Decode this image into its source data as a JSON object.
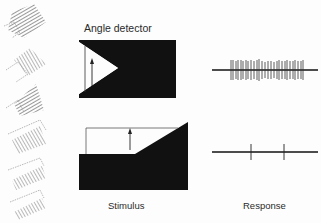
{
  "title": "Angle detector",
  "labels": {
    "stimulus": "Stimulus",
    "response": "Response"
  },
  "colors": {
    "ink": "#111111",
    "hatch": "#555555",
    "paper": "#fdfdfd"
  },
  "left_column": {
    "description": "Stacked hatched angle stimuli at different orientations",
    "count": 6
  },
  "rows": [
    {
      "name": "preferred-angle",
      "stimulus_shape": "black rectangle with white wedge notch pointing right, upward arrow inside",
      "response": "dense burst of spikes",
      "spike_count": 34
    },
    {
      "name": "non-preferred-angle",
      "stimulus_shape": "black block with shallow diagonal edge, white outlined region above, upward arrow",
      "response": "sparse spikes",
      "spike_count": 2
    }
  ]
}
